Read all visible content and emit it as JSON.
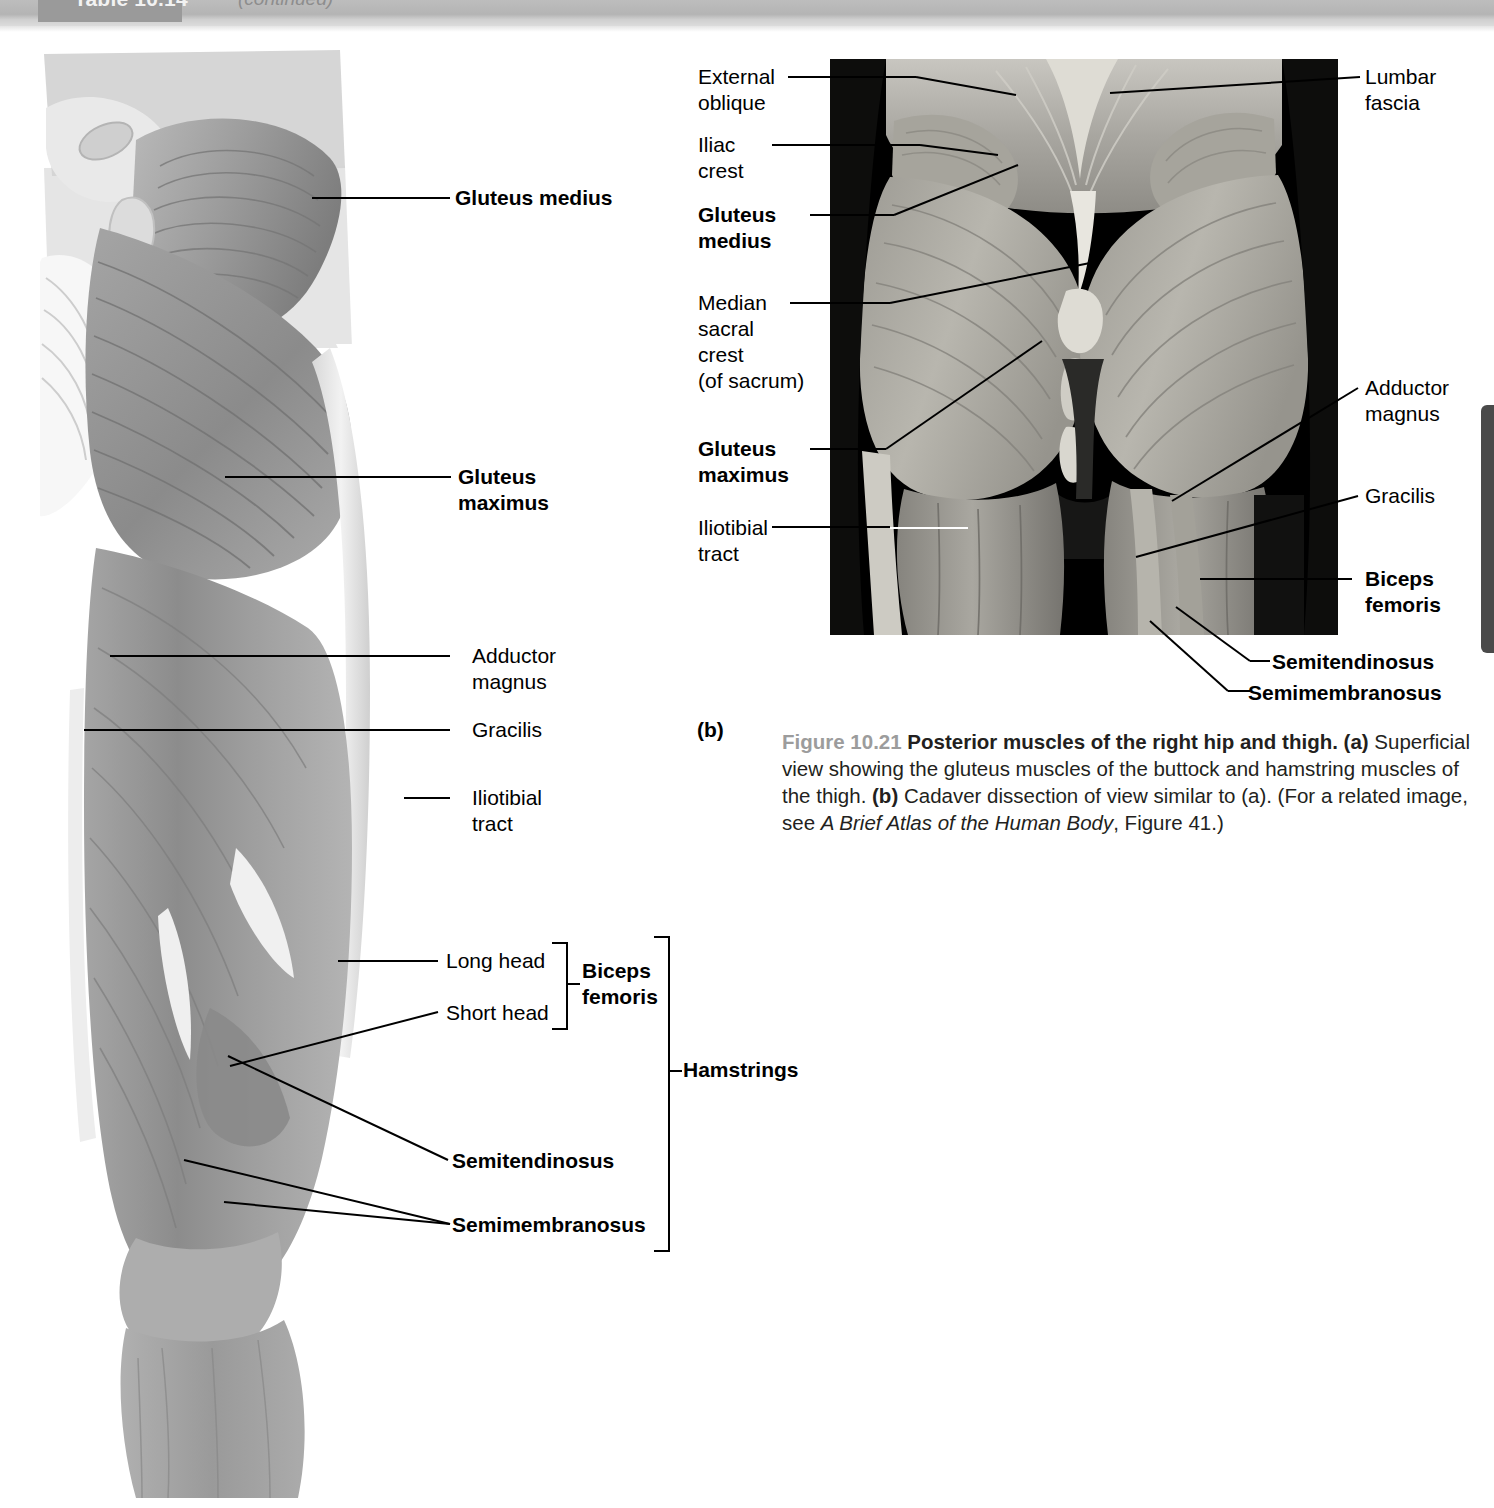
{
  "table_header": {
    "title": "Table 10.14",
    "continued": "(continued)"
  },
  "figure": {
    "number": "Figure 10.21",
    "title": "Posterior muscles of the right hip and thigh.",
    "part_a_marker": "(a)",
    "part_a_text": " Superficial view showing the gluteus muscles of the buttock and hamstring muscles of the thigh. ",
    "part_b_marker": "(b)",
    "part_b_text": " Cadaver dissection of view similar to (a). (For a related image, see ",
    "atlas_title": "A Brief Atlas of the Human Body",
    "atlas_tail": ", Figure 41.)",
    "panel_b_label": "(b)"
  },
  "illustration_labels": {
    "gluteus_medius": "Gluteus medius",
    "gluteus_maximus_l1": "Gluteus",
    "gluteus_maximus_l2": "maximus",
    "adductor_magnus_l1": "Adductor",
    "adductor_magnus_l2": "magnus",
    "gracilis": "Gracilis",
    "iliotibial_tract_l1": "Iliotibial",
    "iliotibial_tract_l2": "tract",
    "long_head": "Long head",
    "short_head": "Short head",
    "biceps_femoris_l1": "Biceps",
    "biceps_femoris_l2": "femoris",
    "semitendinosus": "Semitendinosus",
    "semimembranosus": "Semimembranosus",
    "hamstrings": "Hamstrings"
  },
  "photo_labels": {
    "external_oblique_l1": "External",
    "external_oblique_l2": "oblique",
    "iliac_crest_l1": "Iliac",
    "iliac_crest_l2": "crest",
    "gluteus_medius_l1": "Gluteus",
    "gluteus_medius_l2": "medius",
    "median_sacral_l1": "Median",
    "median_sacral_l2": "sacral",
    "median_sacral_l3": "crest",
    "median_sacral_l4": "(of sacrum)",
    "gluteus_maximus_l1": "Gluteus",
    "gluteus_maximus_l2": "maximus",
    "iliotibial_tract_l1": "Iliotibial",
    "iliotibial_tract_l2": "tract",
    "lumbar_fascia_l1": "Lumbar",
    "lumbar_fascia_l2": "fascia",
    "adductor_magnus_l1": "Adductor",
    "adductor_magnus_l2": "magnus",
    "gracilis": "Gracilis",
    "biceps_femoris_l1": "Biceps",
    "biceps_femoris_l2": "femoris",
    "semitendinosus": "Semitendinosus",
    "semimembranosus": "Semimembranosus"
  },
  "colors": {
    "header_bar": "#b4b4b4",
    "header_dark": "#9a9a9a",
    "figure_number": "#9c9c9c",
    "page_tab": "#4a4a4a",
    "muscle_mid": "#8f8f8f",
    "muscle_dark": "#6f6f6f",
    "muscle_light": "#c9c9c9"
  }
}
